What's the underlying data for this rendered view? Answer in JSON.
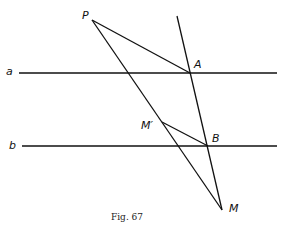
{
  "figure": {
    "caption": "Fig. 67",
    "stroke_color": "#111111",
    "background": "#ffffff"
  },
  "labels": {
    "P": "P",
    "A": "A",
    "B": "B",
    "M_prime": "M′",
    "M": "M",
    "line_a": "a",
    "line_b": "b"
  },
  "points": {
    "P": [
      92,
      20
    ],
    "A": [
      190,
      73
    ],
    "B": [
      208,
      146
    ],
    "M_prime": [
      162,
      122
    ],
    "M": [
      222,
      210
    ]
  },
  "lines": {
    "a": {
      "y": 73,
      "x1": 19,
      "x2": 277
    },
    "b": {
      "y": 146,
      "x1": 22,
      "x2": 277
    },
    "transversal": {
      "from": [
        177,
        16
      ],
      "to": [
        222,
        210
      ]
    }
  }
}
